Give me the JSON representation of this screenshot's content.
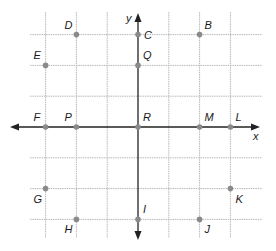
{
  "diagram": {
    "title": "",
    "type": "coordinate-plane",
    "axes": {
      "x_label": "x",
      "y_label": "y"
    },
    "grid": {
      "x_min": -4,
      "x_max": 4,
      "y_min": -4,
      "y_max": 4,
      "lines_x": [
        -3,
        -2,
        -1,
        1,
        2,
        3
      ],
      "lines_y": [
        -3,
        -2,
        -1,
        1,
        2,
        3
      ]
    },
    "colors": {
      "grid": "#b8b8b8",
      "axis": "#222222",
      "point": "#8a8a8a",
      "label": "#1a1a1a"
    },
    "points": [
      {
        "name": "D",
        "x": -2,
        "y": 3,
        "label_pos": "upper-left"
      },
      {
        "name": "C",
        "x": 0,
        "y": 3,
        "label_pos": "right"
      },
      {
        "name": "B",
        "x": 2,
        "y": 3,
        "label_pos": "upper-right"
      },
      {
        "name": "E",
        "x": -3,
        "y": 2,
        "label_pos": "upper-left"
      },
      {
        "name": "Q",
        "x": 0,
        "y": 2,
        "label_pos": "upper-right"
      },
      {
        "name": "F",
        "x": -3,
        "y": 0,
        "label_pos": "upper-left"
      },
      {
        "name": "P",
        "x": -2,
        "y": 0,
        "label_pos": "upper-left"
      },
      {
        "name": "R",
        "x": 0,
        "y": 0,
        "label_pos": "upper-right"
      },
      {
        "name": "M",
        "x": 2,
        "y": 0,
        "label_pos": "upper-right"
      },
      {
        "name": "L",
        "x": 3,
        "y": 0,
        "label_pos": "upper-right"
      },
      {
        "name": "G",
        "x": -3,
        "y": -2,
        "label_pos": "lower-left"
      },
      {
        "name": "K",
        "x": 3,
        "y": -2,
        "label_pos": "lower-right"
      },
      {
        "name": "H",
        "x": -2,
        "y": -3,
        "label_pos": "lower-left"
      },
      {
        "name": "I",
        "x": 0,
        "y": -3,
        "label_pos": "upper-right"
      },
      {
        "name": "J",
        "x": 2,
        "y": -3,
        "label_pos": "lower-right"
      }
    ]
  }
}
